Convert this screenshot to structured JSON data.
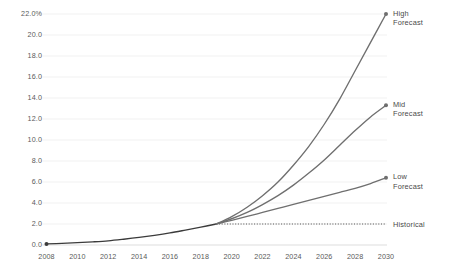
{
  "chart_data": {
    "type": "line",
    "title": "",
    "subtitle": "",
    "xlabel": "",
    "ylabel": "",
    "xlim": [
      2008,
      2030
    ],
    "ylim": [
      0.0,
      22.0
    ],
    "grid": true,
    "legend_position": "right-inline-labels",
    "x_ticks": [
      "2008",
      "2010",
      "2012",
      "2014",
      "2016",
      "2018",
      "2020",
      "2022",
      "2024",
      "2026",
      "2028",
      "2030"
    ],
    "x_tick_values": [
      2008,
      2010,
      2012,
      2014,
      2016,
      2018,
      2020,
      2022,
      2024,
      2026,
      2028,
      2030
    ],
    "y_ticks": [
      "0.0",
      "2.0",
      "4.0",
      "6.0",
      "8.0",
      "10.0",
      "12.0",
      "14.0",
      "16.0",
      "18.0",
      "20.0",
      "22.0%"
    ],
    "y_tick_values": [
      0.0,
      2.0,
      4.0,
      6.0,
      8.0,
      10.0,
      12.0,
      14.0,
      16.0,
      18.0,
      20.0,
      22.0
    ],
    "series": [
      {
        "name": "Historical",
        "label": "Historical",
        "style": "solid",
        "color": "#3b3b3b",
        "x": [
          2008,
          2009,
          2010,
          2011,
          2012,
          2013,
          2014,
          2015,
          2016,
          2017,
          2018,
          2019
        ],
        "values": [
          0.1,
          0.15,
          0.22,
          0.3,
          0.4,
          0.55,
          0.72,
          0.92,
          1.15,
          1.42,
          1.7,
          2.0
        ],
        "marker_start": true,
        "marker_end": false
      },
      {
        "name": "Historical Reference",
        "label": "Historical",
        "style": "dotted",
        "color": "#555555",
        "x": [
          2019,
          2030
        ],
        "values": [
          2.0,
          2.0
        ],
        "marker_start": false,
        "marker_end": false
      },
      {
        "name": "Low Forecast",
        "label": "Low\nForecast",
        "style": "solid",
        "color": "#6f6f6f",
        "x": [
          2019,
          2020,
          2021,
          2022,
          2023,
          2024,
          2025,
          2026,
          2027,
          2028,
          2029,
          2030
        ],
        "values": [
          2.0,
          2.35,
          2.72,
          3.1,
          3.48,
          3.86,
          4.25,
          4.63,
          5.02,
          5.4,
          5.85,
          6.4
        ],
        "marker_start": false,
        "marker_end": true
      },
      {
        "name": "Mid Forecast",
        "label": "Mid\nForecast",
        "style": "solid",
        "color": "#6f6f6f",
        "x": [
          2019,
          2020,
          2021,
          2022,
          2023,
          2024,
          2025,
          2026,
          2027,
          2028,
          2029,
          2030
        ],
        "values": [
          2.0,
          2.5,
          3.1,
          3.85,
          4.7,
          5.7,
          6.85,
          8.1,
          9.5,
          10.9,
          12.2,
          13.3
        ],
        "marker_start": false,
        "marker_end": true
      },
      {
        "name": "High Forecast",
        "label": "High\nForecast",
        "style": "solid",
        "color": "#6f6f6f",
        "x": [
          2019,
          2020,
          2021,
          2022,
          2023,
          2024,
          2025,
          2026,
          2027,
          2028,
          2029,
          2030
        ],
        "values": [
          2.0,
          2.7,
          3.6,
          4.7,
          6.0,
          7.6,
          9.4,
          11.5,
          13.9,
          16.6,
          19.3,
          22.0
        ],
        "marker_start": false,
        "marker_end": true
      }
    ],
    "annotations": [
      {
        "id": "high",
        "text": "High\nForecast",
        "x": 2030,
        "y": 22.0
      },
      {
        "id": "mid",
        "text": "Mid\nForecast",
        "x": 2030,
        "y": 13.3
      },
      {
        "id": "low",
        "text": "Low\nForecast",
        "x": 2030,
        "y": 6.4
      },
      {
        "id": "historical",
        "text": "Historical",
        "x": 2030,
        "y": 2.0
      }
    ],
    "colors": {
      "background": "#ffffff",
      "gridline": "#ededed",
      "axis_text": "#5a5a5a",
      "historical_line": "#3b3b3b",
      "forecast_line": "#6f6f6f",
      "annotation_text": "#4a4a4a"
    }
  }
}
